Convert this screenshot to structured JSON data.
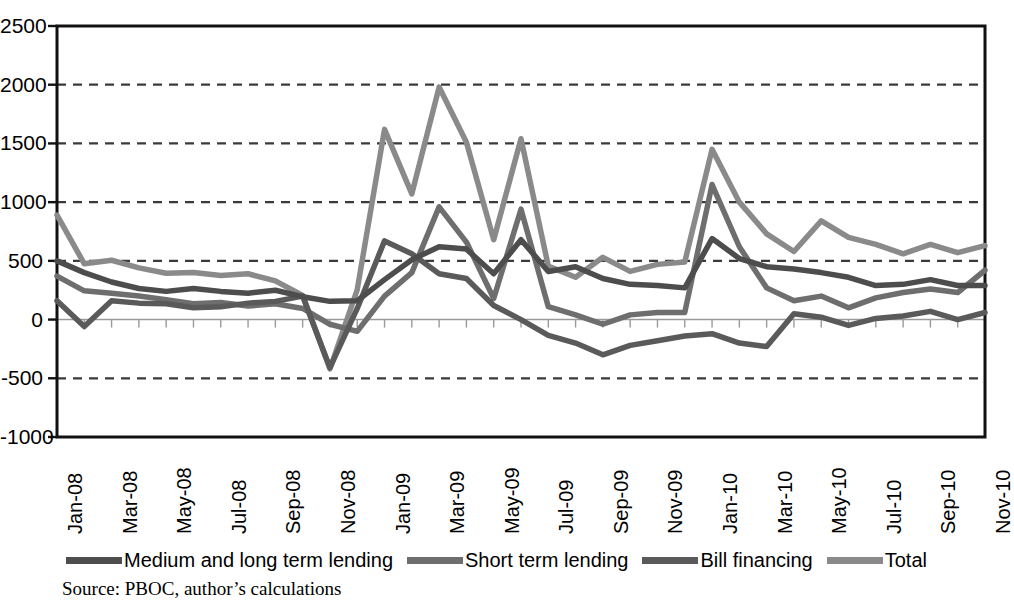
{
  "figure": {
    "source_note": "Source: PBOC, author’s calculations"
  },
  "chart_data": {
    "type": "line",
    "title": "",
    "xlabel": "",
    "ylabel": "",
    "ylim": [
      -1000,
      2500
    ],
    "ytick_values": [
      2500,
      2000,
      1500,
      1000,
      500,
      0,
      -500,
      -1000
    ],
    "ytick_labels": [
      "2500",
      "2000",
      "1500",
      "1000",
      "500",
      "0",
      "-500",
      "-1000"
    ],
    "grid": "horizontal-dashed",
    "zero_line": true,
    "legend_position": "bottom",
    "x": [
      "Jan-08",
      "Feb-08",
      "Mar-08",
      "Apr-08",
      "May-08",
      "Jun-08",
      "Jul-08",
      "Aug-08",
      "Sep-08",
      "Oct-08",
      "Nov-08",
      "Dec-08",
      "Jan-09",
      "Feb-09",
      "Mar-09",
      "Apr-09",
      "May-09",
      "Jun-09",
      "Jul-09",
      "Aug-09",
      "Sep-09",
      "Oct-09",
      "Nov-09",
      "Dec-09",
      "Jan-10",
      "Feb-10",
      "Mar-10",
      "Apr-10",
      "May-10",
      "Jun-10",
      "Jul-10",
      "Aug-10",
      "Sep-10",
      "Oct-10",
      "Nov-10"
    ],
    "xtick_labels": [
      "Jan-08",
      "Mar-08",
      "May-08",
      "Jul-08",
      "Sep-08",
      "Nov-08",
      "Jan-09",
      "Mar-09",
      "May-09",
      "Jul-09",
      "Sep-09",
      "Nov-09",
      "Jan-10",
      "Mar-10",
      "May-10",
      "Jul-10",
      "Sep-10",
      "Nov-10"
    ],
    "xtick_indices": [
      0,
      2,
      4,
      6,
      8,
      10,
      12,
      14,
      16,
      18,
      20,
      22,
      24,
      26,
      28,
      30,
      32,
      34
    ],
    "series": [
      {
        "name": "Medium and long term lending",
        "color": "#4d4d4d",
        "values": [
          500,
          400,
          320,
          265,
          240,
          265,
          240,
          225,
          250,
          195,
          155,
          160,
          340,
          510,
          620,
          600,
          390,
          680,
          410,
          450,
          350,
          300,
          290,
          270,
          690,
          520,
          450,
          430,
          400,
          360,
          290,
          300,
          340,
          290,
          290
        ]
      },
      {
        "name": "Short term lending",
        "color": "#6e6e6e",
        "values": [
          370,
          245,
          225,
          200,
          170,
          135,
          145,
          115,
          135,
          95,
          -40,
          -100,
          200,
          400,
          960,
          660,
          180,
          940,
          110,
          40,
          -40,
          40,
          60,
          60,
          1150,
          620,
          270,
          160,
          200,
          100,
          185,
          230,
          260,
          230,
          420
        ]
      },
      {
        "name": "Bill financing",
        "color": "#5a5a5a",
        "values": [
          160,
          -60,
          160,
          140,
          135,
          100,
          110,
          140,
          155,
          200,
          -410,
          95,
          670,
          560,
          390,
          350,
          120,
          0,
          -135,
          -200,
          -300,
          -220,
          -180,
          -140,
          -120,
          -200,
          -230,
          50,
          20,
          -50,
          10,
          30,
          70,
          0,
          60
        ]
      },
      {
        "name": "Total",
        "color": "#8a8a8a",
        "values": [
          890,
          475,
          505,
          440,
          395,
          400,
          375,
          390,
          330,
          205,
          -420,
          255,
          1620,
          1070,
          1980,
          1510,
          680,
          1540,
          455,
          360,
          530,
          410,
          470,
          490,
          1450,
          1000,
          730,
          580,
          840,
          700,
          640,
          560,
          640,
          570,
          630
        ]
      }
    ]
  },
  "legend": {
    "entries": [
      {
        "label": "Medium and long term lending",
        "color": "#4d4d4d"
      },
      {
        "label": "Short term lending",
        "color": "#6e6e6e"
      },
      {
        "label": "Bill financing",
        "color": "#5a5a5a"
      },
      {
        "label": "Total",
        "color": "#8a8a8a"
      }
    ]
  }
}
